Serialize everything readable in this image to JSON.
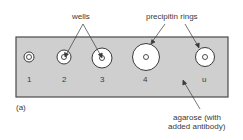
{
  "labels": {
    "wells": "wells",
    "precipitin_rings": "precipitin rings",
    "agarose_line1": "agarose (with",
    "agarose_line2": "added antibody)",
    "panel": "(a)"
  },
  "wells": [
    {
      "id": "1",
      "label": "1",
      "ring_radius": 5
    },
    {
      "id": "2",
      "label": "2",
      "ring_radius": 7
    },
    {
      "id": "3",
      "label": "3",
      "ring_radius": 10
    },
    {
      "id": "4",
      "label": "4",
      "ring_radius": 13
    },
    {
      "id": "u",
      "label": "u",
      "ring_radius": 10
    }
  ],
  "colors": {
    "agarose": "#cfcfcf",
    "border": "#4a4a4a",
    "ring_fill": "#ffffff"
  }
}
